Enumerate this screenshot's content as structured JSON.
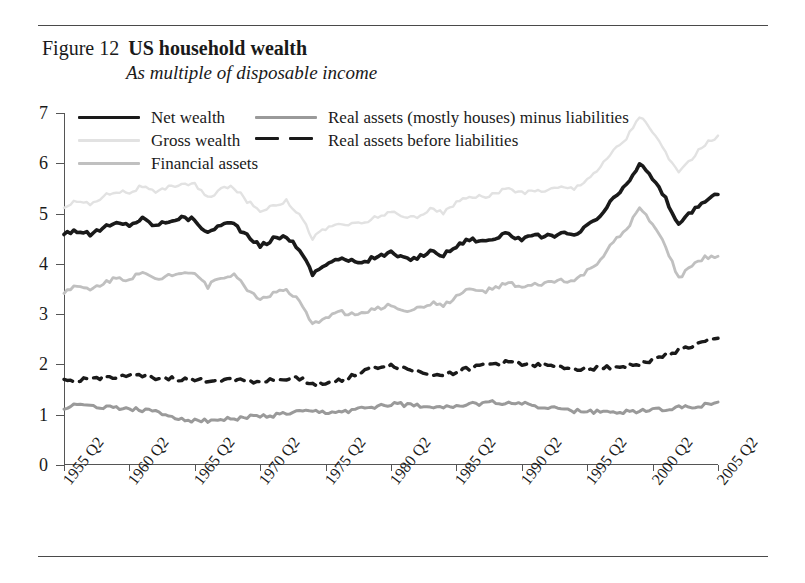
{
  "figure": {
    "label": "Figure 12",
    "title": "US household wealth",
    "subtitle": "As multiple of disposable income"
  },
  "legend": {
    "column_a": [
      {
        "label": "Net wealth",
        "style": "solid",
        "color": "#1a1a1a",
        "width": 3.6
      },
      {
        "label": "Gross wealth",
        "style": "solid",
        "color": "#e2e2e2",
        "width": 2.2
      },
      {
        "label": "Financial assets",
        "style": "solid",
        "color": "#c0c0c0",
        "width": 2.8
      }
    ],
    "column_b": [
      {
        "label": "Real assets (mostly houses) minus liabilities",
        "style": "solid",
        "color": "#9a9a9a",
        "width": 3.0
      },
      {
        "label": "Real assets before liabilities",
        "style": "dashed",
        "color": "#1a1a1a",
        "width": 3.4
      }
    ]
  },
  "axes": {
    "y_ticks": [
      "7",
      "6",
      "5",
      "4",
      "3",
      "2",
      "1",
      "0"
    ],
    "y_min": 0,
    "y_max": 7,
    "x_ticks": [
      "1955 Q2",
      "1960 Q2",
      "1965 Q2",
      "1970 Q2",
      "1975 Q2",
      "1980 Q2",
      "1985 Q2",
      "1990 Q2",
      "1995 Q2",
      "2000 Q2",
      "2005 Q2"
    ],
    "x_min": 1955.25,
    "x_max": 2005.25,
    "grid": false
  },
  "chart_data": {
    "type": "line",
    "title": "US household wealth",
    "subtitle": "As multiple of disposable income",
    "xlabel": "",
    "ylabel": "",
    "ylim": [
      0,
      7
    ],
    "xlim": [
      1955.25,
      2005.25
    ],
    "grid": false,
    "legend_position": "top-inside",
    "x": [
      1955.25,
      1956.25,
      1957.25,
      1958.25,
      1959.25,
      1960.25,
      1961.25,
      1962.25,
      1963.25,
      1964.25,
      1965.25,
      1966.25,
      1967.25,
      1968.25,
      1969.25,
      1970.25,
      1971.25,
      1972.25,
      1973.25,
      1974.25,
      1975.25,
      1976.25,
      1977.25,
      1978.25,
      1979.25,
      1980.25,
      1981.25,
      1982.25,
      1983.25,
      1984.25,
      1985.25,
      1986.25,
      1987.25,
      1988.25,
      1989.25,
      1990.25,
      1991.25,
      1992.25,
      1993.25,
      1994.25,
      1995.25,
      1996.25,
      1997.25,
      1998.25,
      1999.25,
      2000.25,
      2001.25,
      2002.25,
      2003.25,
      2004.25,
      2005.25
    ],
    "series": [
      {
        "name": "Net wealth",
        "color": "#1a1a1a",
        "style": "solid",
        "width": 3.6,
        "values": [
          4.62,
          4.66,
          4.58,
          4.72,
          4.8,
          4.78,
          4.9,
          4.76,
          4.86,
          4.92,
          4.88,
          4.6,
          4.8,
          4.8,
          4.55,
          4.35,
          4.5,
          4.55,
          4.3,
          3.8,
          4.0,
          4.1,
          4.05,
          4.05,
          4.15,
          4.22,
          4.1,
          4.12,
          4.25,
          4.18,
          4.35,
          4.5,
          4.45,
          4.52,
          4.6,
          4.48,
          4.55,
          4.55,
          4.6,
          4.55,
          4.75,
          4.95,
          5.3,
          5.55,
          6.0,
          5.7,
          5.3,
          4.75,
          5.05,
          5.25,
          5.38
        ]
      },
      {
        "name": "Gross wealth",
        "color": "#e2e2e2",
        "style": "solid",
        "width": 2.4,
        "values": [
          5.15,
          5.25,
          5.18,
          5.35,
          5.45,
          5.42,
          5.55,
          5.4,
          5.52,
          5.6,
          5.58,
          5.3,
          5.5,
          5.52,
          5.25,
          5.05,
          5.18,
          5.25,
          5.0,
          4.52,
          4.7,
          4.8,
          4.78,
          4.82,
          4.95,
          5.02,
          4.92,
          4.95,
          5.08,
          5.02,
          5.2,
          5.35,
          5.32,
          5.4,
          5.5,
          5.4,
          5.45,
          5.48,
          5.52,
          5.5,
          5.7,
          5.92,
          6.25,
          6.5,
          6.95,
          6.62,
          6.22,
          5.78,
          6.1,
          6.38,
          6.55
        ]
      },
      {
        "name": "Financial assets",
        "color": "#c0c0c0",
        "style": "solid",
        "width": 2.8,
        "values": [
          3.45,
          3.55,
          3.48,
          3.62,
          3.72,
          3.7,
          3.82,
          3.68,
          3.78,
          3.85,
          3.82,
          3.55,
          3.75,
          3.78,
          3.5,
          3.3,
          3.42,
          3.48,
          3.25,
          2.78,
          2.95,
          3.05,
          3.0,
          3.02,
          3.12,
          3.18,
          3.08,
          3.1,
          3.22,
          3.18,
          3.35,
          3.5,
          3.45,
          3.52,
          3.62,
          3.52,
          3.58,
          3.62,
          3.68,
          3.65,
          3.85,
          4.08,
          4.42,
          4.68,
          5.1,
          4.78,
          4.35,
          3.7,
          3.98,
          4.12,
          4.15
        ]
      },
      {
        "name": "Real assets (mostly houses) minus liabilities",
        "color": "#9a9a9a",
        "style": "solid",
        "width": 3.0,
        "values": [
          1.15,
          1.18,
          1.18,
          1.16,
          1.14,
          1.12,
          1.1,
          1.05,
          0.98,
          0.92,
          0.88,
          0.88,
          0.9,
          0.92,
          0.95,
          0.96,
          0.98,
          1.02,
          1.05,
          1.05,
          1.04,
          1.05,
          1.08,
          1.12,
          1.18,
          1.22,
          1.2,
          1.18,
          1.18,
          1.16,
          1.18,
          1.2,
          1.22,
          1.25,
          1.24,
          1.22,
          1.18,
          1.14,
          1.1,
          1.08,
          1.06,
          1.05,
          1.05,
          1.06,
          1.08,
          1.1,
          1.12,
          1.14,
          1.16,
          1.2,
          1.25
        ]
      },
      {
        "name": "Real assets before liabilities",
        "color": "#1a1a1a",
        "style": "dashed",
        "width": 3.4,
        "values": [
          1.66,
          1.7,
          1.72,
          1.74,
          1.76,
          1.78,
          1.76,
          1.74,
          1.72,
          1.7,
          1.68,
          1.68,
          1.7,
          1.7,
          1.68,
          1.66,
          1.68,
          1.72,
          1.72,
          1.62,
          1.62,
          1.68,
          1.78,
          1.88,
          1.95,
          1.98,
          1.92,
          1.86,
          1.82,
          1.8,
          1.85,
          1.92,
          1.98,
          2.02,
          2.04,
          2.02,
          2.0,
          1.96,
          1.94,
          1.92,
          1.92,
          1.94,
          1.95,
          1.96,
          2.02,
          2.08,
          2.18,
          2.28,
          2.36,
          2.44,
          2.52
        ]
      }
    ]
  }
}
